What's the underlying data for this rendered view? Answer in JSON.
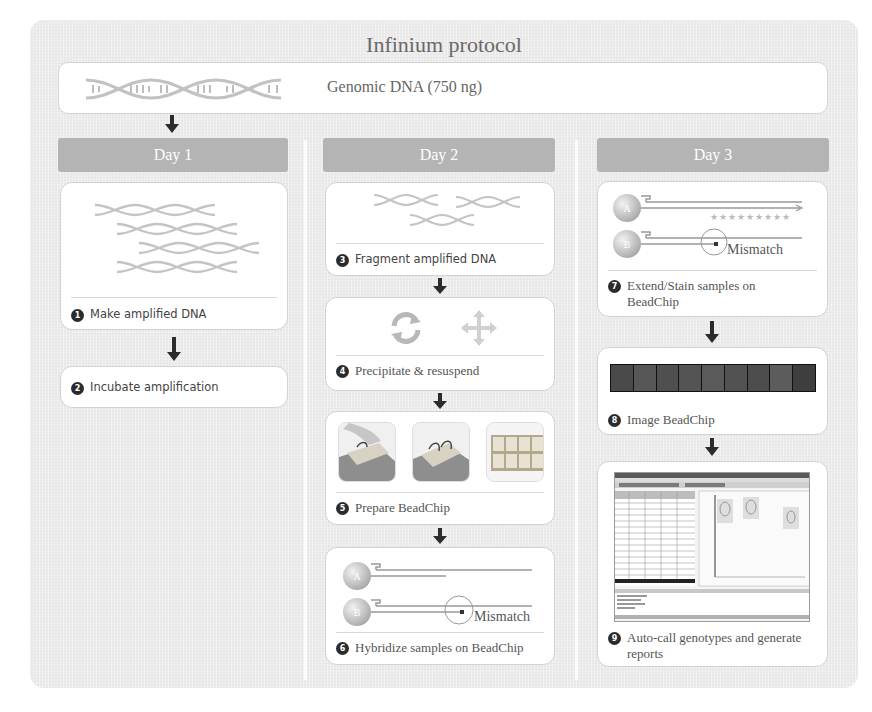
{
  "title": "Infinium protocol",
  "input": {
    "label": "Genomic DNA (750 ng)",
    "icon": "dna-helix-icon"
  },
  "days": [
    {
      "label": "Day 1",
      "steps": [
        {
          "number": "1",
          "label": "Make amplified DNA",
          "illustration": "amplified-dna-strands"
        },
        {
          "number": "2",
          "label": "Incubate amplification",
          "illustration": null
        }
      ]
    },
    {
      "label": "Day 2",
      "steps": [
        {
          "number": "3",
          "label": "Fragment amplified DNA",
          "illustration": "fragmented-dna"
        },
        {
          "number": "4",
          "label": "Precipitate & resuspend",
          "illustration": "refresh-and-move-icons"
        },
        {
          "number": "5",
          "label": "Prepare BeadChip",
          "illustration": "beadchip-preparation-photos"
        },
        {
          "number": "6",
          "label": "Hybridize samples on BeadChip",
          "illustration": "bead-probes-hybridization",
          "beads": [
            "A",
            "B"
          ],
          "annotation": "Mismatch"
        }
      ]
    },
    {
      "label": "Day 3",
      "steps": [
        {
          "number": "7",
          "label": "Extend/Stain samples on BeadChip",
          "illustration": "bead-probes-extension",
          "beads": [
            "A",
            "B"
          ],
          "annotation": "Mismatch",
          "stars": "★★★★★★★★★"
        },
        {
          "number": "8",
          "label": "Image BeadChip",
          "illustration": "beadchip-scan-image"
        },
        {
          "number": "9",
          "label": "Auto-call genotypes and generate reports",
          "illustration": "genotyping-software-screenshot"
        }
      ]
    }
  ],
  "colors": {
    "panel_bg": "#ebebeb",
    "day_header_bg": "#b4b4b4",
    "card_bg": "#ffffff",
    "dna_strand": "#c4c4c4",
    "badge": "#2b2b2b",
    "arrow": "#2b2b2b",
    "bead": "#c9c9c9"
  }
}
